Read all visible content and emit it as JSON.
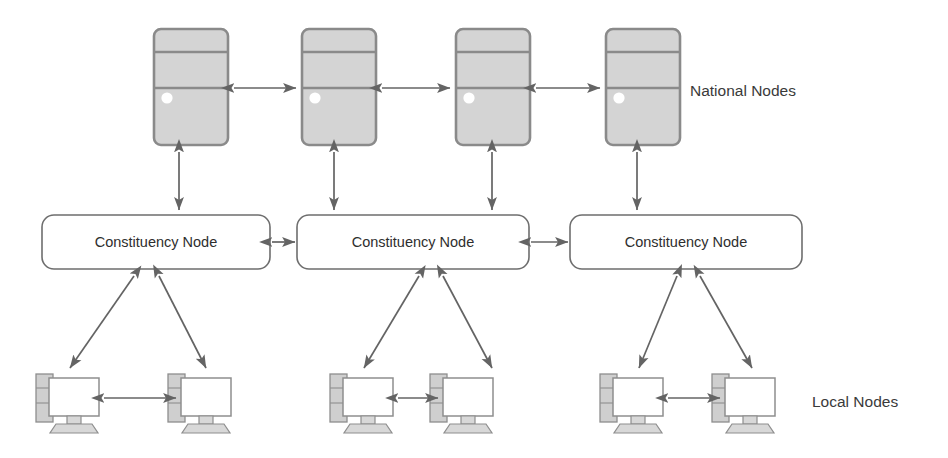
{
  "diagram": {
    "background_color": "#ffffff",
    "line_color": "#646464",
    "server_fill_color": "#d4d4d4",
    "server_stroke_color": "#8a8a8a",
    "box_fill_color": "#ffffff",
    "box_stroke_color": "#6e6e6e",
    "text_color": "#2e2e2e"
  },
  "tiers": [
    {
      "id": "national",
      "label": "National Nodes",
      "label_x": 690,
      "label_y": 92,
      "icon": "server-tower-icon",
      "count": 4
    },
    {
      "id": "constituency",
      "label": "Constituency Node",
      "icon": "rounded-box",
      "count": 3
    },
    {
      "id": "local",
      "label": "Local Nodes",
      "label_x": 812,
      "label_y": 403,
      "icon": "desktop-computer-icon",
      "count": 6
    }
  ],
  "national_nodes": [
    {
      "id": "national-node-1",
      "label": "National Node 1",
      "x": 154,
      "y": 29,
      "w": 74,
      "h": 116
    },
    {
      "id": "national-node-2",
      "label": "National Node 2",
      "x": 302,
      "y": 29,
      "w": 74,
      "h": 116
    },
    {
      "id": "national-node-3",
      "label": "National Node 3",
      "x": 456,
      "y": 29,
      "w": 74,
      "h": 116
    },
    {
      "id": "national-node-4",
      "label": "National Node 4",
      "x": 606,
      "y": 29,
      "w": 74,
      "h": 116
    }
  ],
  "constituency_nodes": [
    {
      "id": "constituency-node-1",
      "label": "Constituency Node",
      "x": 42,
      "y": 215,
      "w": 228,
      "h": 54
    },
    {
      "id": "constituency-node-2",
      "label": "Constituency Node",
      "x": 297,
      "y": 215,
      "w": 232,
      "h": 54
    },
    {
      "id": "constituency-node-3",
      "label": "Constituency Node",
      "x": 570,
      "y": 215,
      "w": 232,
      "h": 54
    }
  ],
  "local_nodes": [
    {
      "id": "local-node-1",
      "label": "Local Node 1",
      "x": 36,
      "y": 372
    },
    {
      "id": "local-node-2",
      "label": "Local Node 2",
      "x": 168,
      "y": 372
    },
    {
      "id": "local-node-3",
      "label": "Local Node 3",
      "x": 330,
      "y": 372
    },
    {
      "id": "local-node-4",
      "label": "Local Node 4",
      "x": 430,
      "y": 372
    },
    {
      "id": "local-node-5",
      "label": "Local Node 5",
      "x": 600,
      "y": 372
    },
    {
      "id": "local-node-6",
      "label": "Local Node 6",
      "x": 712,
      "y": 372
    }
  ],
  "links": {
    "national_peer": [
      {
        "id": "link-n1-n2",
        "from": "national-node-1",
        "to": "national-node-2",
        "x1": 234,
        "y1": 88,
        "x2": 296,
        "y2": 88,
        "arrows": "both"
      },
      {
        "id": "link-n2-n3",
        "from": "national-node-2",
        "to": "national-node-3",
        "x1": 382,
        "y1": 88,
        "x2": 450,
        "y2": 88,
        "arrows": "both"
      },
      {
        "id": "link-n3-n4",
        "from": "national-node-3",
        "to": "national-node-4",
        "x1": 536,
        "y1": 88,
        "x2": 600,
        "y2": 88,
        "arrows": "both"
      }
    ],
    "national_to_constituency": [
      {
        "id": "link-n1-c1",
        "from": "national-node-1",
        "to": "constituency-node-1",
        "x1": 179,
        "y1": 152,
        "x2": 179,
        "y2": 210,
        "arrows": "both"
      },
      {
        "id": "link-n2-c2",
        "from": "national-node-2",
        "to": "constituency-node-2",
        "x1": 334,
        "y1": 152,
        "x2": 334,
        "y2": 210,
        "arrows": "both"
      },
      {
        "id": "link-n3-c2",
        "from": "national-node-3",
        "to": "constituency-node-2",
        "x1": 492,
        "y1": 152,
        "x2": 492,
        "y2": 210,
        "arrows": "both"
      },
      {
        "id": "link-n4-c3",
        "from": "national-node-4",
        "to": "constituency-node-3",
        "x1": 637,
        "y1": 152,
        "x2": 637,
        "y2": 210,
        "arrows": "both"
      }
    ],
    "constituency_peer": [
      {
        "id": "link-c1-c2",
        "from": "constituency-node-1",
        "to": "constituency-node-2",
        "x1": 266,
        "y1": 242,
        "x2": 301,
        "y2": 242,
        "arrows": "both"
      },
      {
        "id": "link-c2-c3",
        "from": "constituency-node-2",
        "to": "constituency-node-3",
        "x1": 533,
        "y1": 242,
        "x2": 574,
        "y2": 242,
        "arrows": "both"
      }
    ],
    "constituency_to_local": [
      {
        "id": "link-c1-l1",
        "from": "constituency-node-1",
        "to": "local-node-1",
        "x1": 134,
        "y1": 275,
        "x2": 70,
        "y2": 368,
        "arrows": "both"
      },
      {
        "id": "link-c1-l2",
        "from": "constituency-node-1",
        "to": "local-node-2",
        "x1": 158,
        "y1": 275,
        "x2": 205,
        "y2": 368,
        "arrows": "both"
      },
      {
        "id": "link-c2-l3",
        "from": "constituency-node-2",
        "to": "local-node-3",
        "x1": 418,
        "y1": 275,
        "x2": 363,
        "y2": 368,
        "arrows": "both"
      },
      {
        "id": "link-c2-l4",
        "from": "constituency-node-2",
        "to": "local-node-4",
        "x1": 442,
        "y1": 275,
        "x2": 492,
        "y2": 368,
        "arrows": "both"
      },
      {
        "id": "link-c3-l5",
        "from": "constituency-node-3",
        "to": "local-node-5",
        "x1": 676,
        "y1": 275,
        "x2": 638,
        "y2": 368,
        "arrows": "both"
      },
      {
        "id": "link-c3-l6",
        "from": "constituency-node-3",
        "to": "local-node-6",
        "x1": 700,
        "y1": 275,
        "x2": 752,
        "y2": 368,
        "arrows": "both"
      }
    ],
    "local_peer": [
      {
        "id": "link-l1-l2",
        "from": "local-node-1",
        "to": "local-node-2",
        "x1": 110,
        "y1": 398,
        "x2": 172,
        "y2": 398,
        "arrows": "both"
      },
      {
        "id": "link-l3-l4",
        "from": "local-node-3",
        "to": "local-node-4",
        "x1": 404,
        "y1": 398,
        "x2": 462,
        "y2": 398,
        "arrows": "both"
      },
      {
        "id": "link-l5-l6",
        "from": "local-node-5",
        "to": "local-node-6",
        "x1": 676,
        "y1": 398,
        "x2": 734,
        "y2": 398,
        "arrows": "both"
      }
    ]
  }
}
